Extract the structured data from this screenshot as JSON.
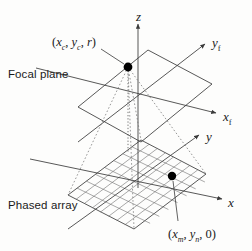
{
  "figure": {
    "background_color": "#fdfdfc",
    "line_color": "#3a3a3a",
    "dash_color": "#6a6a6a",
    "dot_color": "#000000"
  },
  "labels": {
    "focal_plane": "Focal plane",
    "phased_array": "Phased array"
  },
  "axes": [
    {
      "name": "z-axis",
      "label": "z",
      "sub": "",
      "x": 136,
      "y": 10
    },
    {
      "name": "yf-axis",
      "label": "y",
      "sub": "f",
      "x": 212,
      "y": 36
    },
    {
      "name": "xf-axis",
      "label": "x",
      "sub": "f",
      "x": 223,
      "y": 110
    },
    {
      "name": "y-axis",
      "label": "y",
      "sub": "",
      "x": 206,
      "y": 130
    },
    {
      "name": "x-axis",
      "label": "x",
      "sub": "",
      "x": 228,
      "y": 196
    }
  ],
  "points": [
    {
      "name": "focal-point",
      "coord_open": "(",
      "v1": "x",
      "v1sub": "c",
      "sep1": ", ",
      "v2": "y",
      "v2sub": "c",
      "sep2": ", ",
      "v3": "r",
      "v3sub": "",
      "coord_close": ")",
      "label_x": 52,
      "label_y": 36,
      "dot_x": 128,
      "dot_y": 67
    },
    {
      "name": "array-element",
      "coord_open": "(",
      "v1": "x",
      "v1sub": "m",
      "sep1": ", ",
      "v2": "y",
      "v2sub": "n",
      "sep2": ", ",
      "v3": "0",
      "v3sub": "",
      "coord_close": ")",
      "label_x": 168,
      "label_y": 228,
      "dot_x": 172,
      "dot_y": 176
    }
  ],
  "planes": [
    {
      "name": "focal-plane-quad",
      "note": "upper parallelogram, plain outline"
    },
    {
      "name": "phased-array-quad",
      "note": "lower parallelogram with rectangular mesh grid"
    }
  ]
}
